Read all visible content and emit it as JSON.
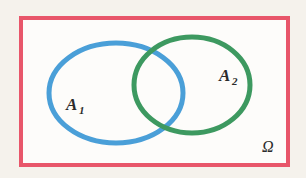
{
  "figure": {
    "type": "venn-diagram",
    "width": 306,
    "height": 178,
    "background_color": "#f5f2ec",
    "interior_color": "#fdfcfa"
  },
  "universe": {
    "name": "sample-space",
    "label": "Ω",
    "label_x": 262,
    "label_y": 152,
    "border_color": "#e8566a",
    "border_width": 4,
    "rect": {
      "x": 21,
      "y": 18,
      "width": 267,
      "height": 147
    }
  },
  "sets": [
    {
      "id": "A1",
      "name": "set-a1",
      "label_main": "A",
      "label_sub": "1",
      "color": "#4a9fd8",
      "stroke_width": 5,
      "cx": 116,
      "cy": 93,
      "rx": 67,
      "ry": 50,
      "label_x": 66,
      "label_y": 110
    },
    {
      "id": "A2",
      "name": "set-a2",
      "label_main": "A",
      "label_sub": "2",
      "color": "#3d9960",
      "stroke_width": 5,
      "cx": 192,
      "cy": 85,
      "rx": 58,
      "ry": 48,
      "label_x": 219,
      "label_y": 81
    }
  ],
  "colors": {
    "red": "#e8566a",
    "blue": "#4a9fd8",
    "green": "#3d9960",
    "text": "#2b2b2b",
    "page": "#f5f2ec"
  }
}
